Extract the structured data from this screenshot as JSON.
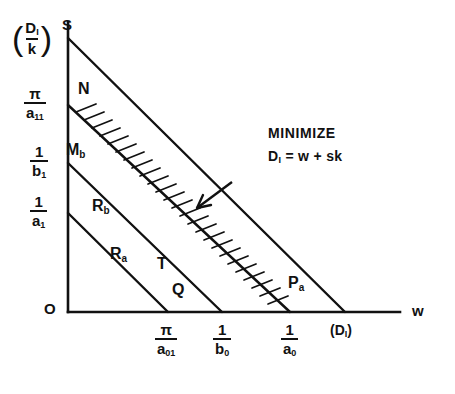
{
  "figure": {
    "type": "diagram",
    "axes": {
      "y_axis_name": "S",
      "x_axis_name": "w",
      "origin_label": "O"
    },
    "y_ticks": [
      {
        "id": "D1_over_k",
        "num": "D",
        "num_sub": "I",
        "den": "k",
        "parenthesized": true,
        "y": 38
      },
      {
        "id": "pi_over_a11",
        "num": "π",
        "den": "a",
        "den_sub": "11",
        "y": 105
      },
      {
        "id": "one_over_b1",
        "num": "1",
        "den": "b",
        "den_sub": "1",
        "y": 163
      },
      {
        "id": "one_over_a1",
        "num": "1",
        "den": "a",
        "den_sub": "1",
        "y": 213
      }
    ],
    "x_ticks": [
      {
        "id": "pi_over_a01",
        "num": "π",
        "den": "a",
        "den_sub": "01",
        "x": 168
      },
      {
        "id": "one_over_b0",
        "num": "1",
        "den": "b",
        "den_sub": "0",
        "x": 222
      },
      {
        "id": "one_over_a0",
        "num": "1",
        "den": "a",
        "den_sub": "0",
        "x": 290
      },
      {
        "id": "D1_end",
        "text": "(D",
        "sub": "I",
        "text_end": ")",
        "x": 345
      }
    ],
    "points": [
      {
        "id": "N",
        "label": "N",
        "sub": "",
        "x": 78,
        "y": 88
      },
      {
        "id": "Mb",
        "label": "M",
        "sub": "b",
        "x": 68,
        "y": 148
      },
      {
        "id": "Rb",
        "label": "R",
        "sub": "b",
        "x": 96,
        "y": 205
      },
      {
        "id": "Ra",
        "label": "R",
        "sub": "a",
        "x": 113,
        "y": 252
      },
      {
        "id": "T",
        "label": "T",
        "sub": "",
        "x": 157,
        "y": 262
      },
      {
        "id": "Q",
        "label": "Q",
        "sub": "",
        "x": 172,
        "y": 288
      },
      {
        "id": "Pa",
        "label": "P",
        "sub": "a",
        "x": 292,
        "y": 280
      }
    ],
    "annotation": {
      "line1": "MINIMIZE",
      "line2_lhs": "D",
      "line2_sub": "I",
      "line2_rhs": "= w + sk"
    },
    "colors": {
      "ink": "#111111",
      "background": "#ffffff"
    }
  }
}
